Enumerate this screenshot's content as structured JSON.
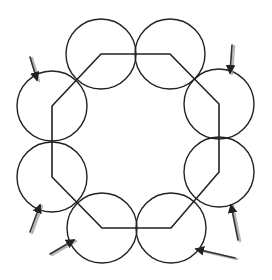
{
  "diagram": {
    "circle_radius": 35,
    "stroke_color": "#222222",
    "arrow_color": "#333333",
    "arrow_shadow_color": "#999999",
    "circles": [
      {
        "id": "top-left",
        "cx": 101,
        "cy": 54
      },
      {
        "id": "top-right",
        "cx": 170,
        "cy": 54
      },
      {
        "id": "right-upper",
        "cx": 219,
        "cy": 104
      },
      {
        "id": "right-lower",
        "cx": 219,
        "cy": 172
      },
      {
        "id": "bottom-right",
        "cx": 171,
        "cy": 228
      },
      {
        "id": "bottom-left",
        "cx": 102,
        "cy": 228
      },
      {
        "id": "left-lower",
        "cx": 52,
        "cy": 177
      },
      {
        "id": "left-upper",
        "cx": 52,
        "cy": 106
      }
    ],
    "arrows": [
      {
        "id": "arrow-left-upper",
        "x1": 30,
        "y1": 57,
        "x2": 37,
        "y2": 80
      },
      {
        "id": "arrow-right-upper",
        "x1": 232,
        "y1": 45,
        "x2": 230,
        "y2": 73
      },
      {
        "id": "arrow-right-lower",
        "x1": 238,
        "y1": 240,
        "x2": 231,
        "y2": 205
      },
      {
        "id": "arrow-left-lower",
        "x1": 30,
        "y1": 232,
        "x2": 40,
        "y2": 205
      },
      {
        "id": "arrow-bottom-left",
        "x1": 50,
        "y1": 254,
        "x2": 74,
        "y2": 240
      },
      {
        "id": "arrow-bottom-right",
        "x1": 235,
        "y1": 258,
        "x2": 196,
        "y2": 249
      }
    ]
  }
}
